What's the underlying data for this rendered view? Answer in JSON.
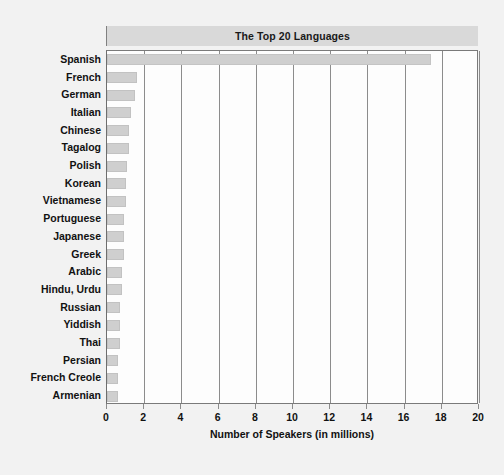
{
  "chart_data": {
    "type": "bar",
    "orientation": "horizontal",
    "title": "The Top 20 Languages",
    "xlabel": "Number of Speakers (in millions)",
    "ylabel": "",
    "xlim": [
      0,
      20
    ],
    "xticks": [
      0,
      2,
      4,
      6,
      8,
      10,
      12,
      14,
      16,
      18,
      20
    ],
    "grid": "vertical",
    "legend": "none",
    "categories": [
      "Spanish",
      "French",
      "German",
      "Italian",
      "Chinese",
      "Tagalog",
      "Polish",
      "Korean",
      "Vietnamese",
      "Portuguese",
      "Japanese",
      "Greek",
      "Arabic",
      "Hindu, Urdu",
      "Russian",
      "Yiddish",
      "Thai",
      "Persian",
      "French Creole",
      "Armenian"
    ],
    "values": [
      17.4,
      1.6,
      1.5,
      1.3,
      1.2,
      1.2,
      1.1,
      1.0,
      1.0,
      0.9,
      0.9,
      0.9,
      0.8,
      0.8,
      0.7,
      0.7,
      0.7,
      0.6,
      0.6,
      0.6
    ]
  },
  "colors": {
    "bar_fill": "#cfcfcf",
    "title_band": "#d9d9d9",
    "gridline": "#8c8c8c",
    "axis": "#6e6e6e",
    "page_background": "#f2f2f2",
    "plot_background": "#fdfdfd",
    "text": "#111111"
  }
}
